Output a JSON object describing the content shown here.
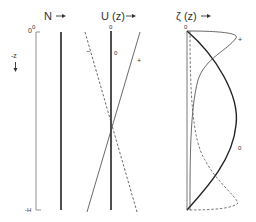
{
  "figure": {
    "panels": [
      {
        "id": "N",
        "title": "N",
        "arrow": "→",
        "description": "Constant buoyancy frequency N with depth"
      },
      {
        "id": "U",
        "title": "U (z)",
        "arrow": "→",
        "curves": [
          {
            "label": "−",
            "style": "dashed"
          },
          {
            "label": "0",
            "style": "thick"
          },
          {
            "label": "+",
            "style": "solid"
          }
        ]
      },
      {
        "id": "zeta",
        "title": "ζ (z)",
        "arrow": "→",
        "curves": [
          {
            "label": "+",
            "style": "solid"
          },
          {
            "label": "0",
            "style": "thick"
          },
          {
            "label": "−",
            "style": "dashed"
          }
        ]
      }
    ],
    "axis": {
      "top_label": "0",
      "bottom_label": "-H",
      "direction_label": "-z",
      "direction_arrow": "↓"
    },
    "u_panel_top_zero": "0",
    "zeta_panel_top_zero": "0"
  }
}
